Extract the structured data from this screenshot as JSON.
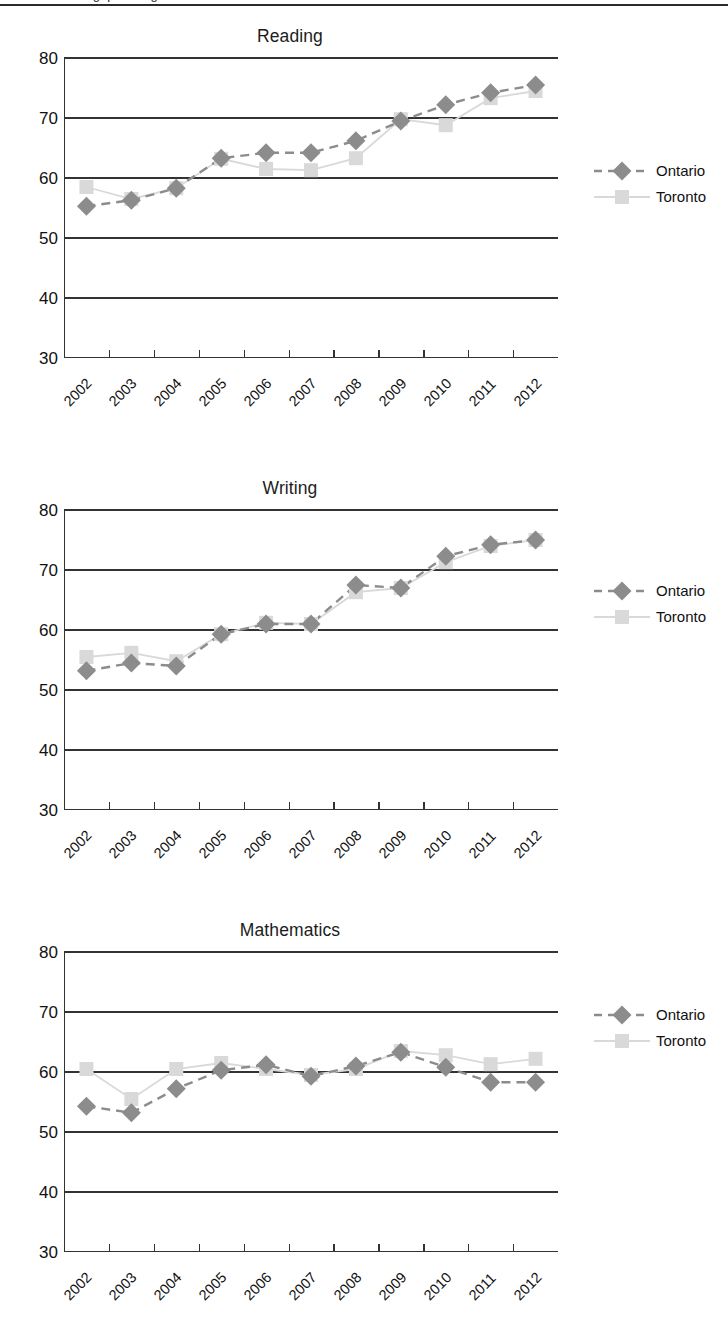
{
  "page": {
    "header_text": "Achievement gap among students"
  },
  "legend": {
    "series": [
      {
        "key": "ontario",
        "label": "Ontario",
        "color": "#8c8c8c",
        "marker": "diamond",
        "line": "dashed"
      },
      {
        "key": "toronto",
        "label": "Toronto",
        "color": "#d9d9d9",
        "marker": "square",
        "line": "solid"
      }
    ]
  },
  "axes": {
    "yticks": [
      80,
      70,
      60,
      50,
      40,
      30
    ],
    "ylim": [
      30,
      80
    ],
    "xticks": [
      "2002",
      "2003",
      "2004",
      "2005",
      "2006",
      "2007",
      "2008",
      "2009",
      "2010",
      "2011",
      "2012"
    ]
  },
  "chart_data": [
    {
      "type": "line",
      "title": "Reading",
      "xlabel": "",
      "ylabel": "",
      "ylim": [
        30,
        80
      ],
      "grid": true,
      "legend_position": "right",
      "categories": [
        "2002",
        "2003",
        "2004",
        "2005",
        "2006",
        "2007",
        "2008",
        "2009",
        "2010",
        "2011",
        "2012"
      ],
      "series": [
        {
          "name": "Ontario",
          "color": "#8c8c8c",
          "marker": "diamond",
          "line": "dashed",
          "values": [
            55.3,
            56.3,
            58.3,
            63.3,
            64.2,
            64.2,
            66.2,
            69.5,
            72.2,
            74.2,
            75.5
          ]
        },
        {
          "name": "Toronto",
          "color": "#d9d9d9",
          "marker": "square",
          "line": "solid",
          "values": [
            58.5,
            56.5,
            58.3,
            63.2,
            61.5,
            61.3,
            63.3,
            69.8,
            68.8,
            73.3,
            74.5
          ]
        }
      ]
    },
    {
      "type": "line",
      "title": "Writing",
      "xlabel": "",
      "ylabel": "",
      "ylim": [
        30,
        80
      ],
      "grid": true,
      "legend_position": "right",
      "categories": [
        "2002",
        "2003",
        "2004",
        "2005",
        "2006",
        "2007",
        "2008",
        "2009",
        "2010",
        "2011",
        "2012"
      ],
      "series": [
        {
          "name": "Ontario",
          "color": "#8c8c8c",
          "marker": "diamond",
          "line": "dashed",
          "values": [
            53.2,
            54.5,
            54.0,
            59.3,
            61.0,
            61.0,
            67.5,
            67.0,
            72.3,
            74.2,
            75.0
          ]
        },
        {
          "name": "Toronto",
          "color": "#d9d9d9",
          "marker": "square",
          "line": "solid",
          "values": [
            55.5,
            56.2,
            54.8,
            59.3,
            61.2,
            61.0,
            66.3,
            67.0,
            71.3,
            74.0,
            75.0
          ]
        }
      ]
    },
    {
      "type": "line",
      "title": "Mathematics",
      "xlabel": "",
      "ylabel": "",
      "ylim": [
        30,
        80
      ],
      "grid": true,
      "legend_position": "right",
      "categories": [
        "2002",
        "2003",
        "2004",
        "2005",
        "2006",
        "2007",
        "2008",
        "2009",
        "2010",
        "2011",
        "2012"
      ],
      "series": [
        {
          "name": "Ontario",
          "color": "#8c8c8c",
          "marker": "diamond",
          "line": "dashed",
          "values": [
            54.3,
            53.2,
            57.2,
            60.3,
            61.2,
            59.3,
            61.0,
            63.3,
            60.8,
            58.3,
            58.3
          ]
        },
        {
          "name": "Toronto",
          "color": "#d9d9d9",
          "marker": "square",
          "line": "solid",
          "values": [
            60.5,
            55.5,
            60.5,
            61.5,
            60.5,
            59.5,
            60.5,
            63.5,
            62.8,
            61.3,
            62.2
          ]
        }
      ]
    }
  ]
}
